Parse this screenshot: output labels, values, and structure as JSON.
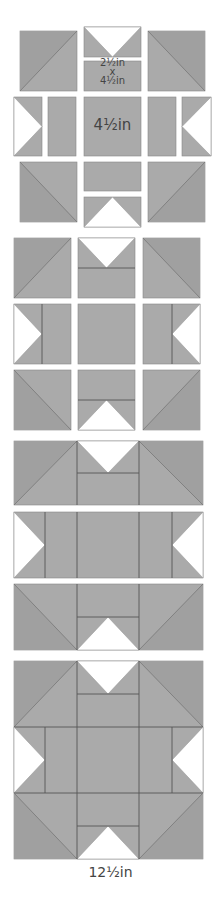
{
  "diagram": {
    "type": "quilt-block-assembly",
    "colors": {
      "fabric": "#aaaaaa",
      "fabric_dark": "#a0a0a0",
      "background": "#ffffff",
      "seam": "#555555"
    },
    "labels": {
      "rect_w": "2½in",
      "rect_x": "x",
      "rect_h": "4½in",
      "center": "4½in",
      "final": "12½in"
    },
    "steps": [
      {
        "step": 1,
        "description": "Separated units: 4 HST corners, 4 flying geese, 4 rectangles, 1 center square"
      },
      {
        "step": 2,
        "description": "Flying geese joined to rectangles forming 3x3 grid"
      },
      {
        "step": 3,
        "description": "Units joined into three rows"
      },
      {
        "step": 4,
        "description": "Rows joined into finished block"
      }
    ]
  }
}
